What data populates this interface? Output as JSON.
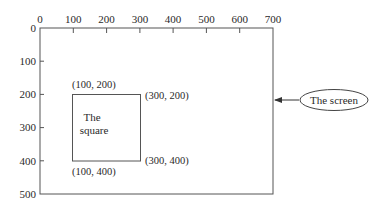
{
  "diagram": {
    "x_axis": {
      "ticks": [
        "0",
        "100",
        "200",
        "300",
        "400",
        "500",
        "600",
        "700"
      ]
    },
    "y_axis": {
      "ticks": [
        "0",
        "100",
        "200",
        "300",
        "400",
        "500"
      ]
    },
    "screen": {
      "label": "The screen"
    },
    "square": {
      "label_line1": "The",
      "label_line2": "square",
      "corners": {
        "top_left": "(100, 200)",
        "top_right": "(300, 200)",
        "bottom_left": "(100, 400)",
        "bottom_right": "(300, 400)"
      }
    },
    "colors": {
      "line": "#555555",
      "text": "#2a2a2a",
      "background": "#ffffff"
    }
  }
}
